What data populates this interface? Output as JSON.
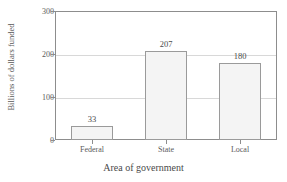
{
  "chart_data": {
    "type": "bar",
    "title": "",
    "title_cropped": true,
    "categories": [
      "Federal",
      "State",
      "Local"
    ],
    "values": [
      33,
      207,
      180
    ],
    "value_labels": [
      "33",
      "207",
      "180"
    ],
    "xlabel": "Area of government",
    "ylabel": "Billions of dollars funded",
    "ylim": [
      0,
      300
    ],
    "yticks": [
      0,
      100,
      200,
      300
    ],
    "ytick_labels": [
      "0",
      "100",
      "200",
      "300"
    ],
    "grid": true,
    "grid_axis": "y",
    "legend": null,
    "bar_fill_color": "#f4f4f4",
    "bar_border_color": "#9a9a9a",
    "axis_color": "#8d8d8d",
    "grid_color": "#d8d8d8",
    "text_color": "#5a5a5a"
  }
}
